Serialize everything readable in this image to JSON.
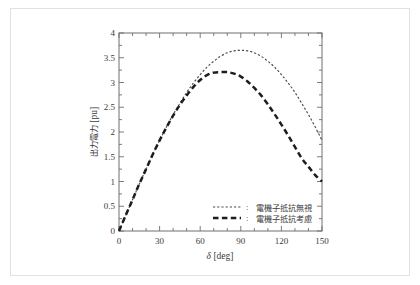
{
  "figure": {
    "frame_border_color": "#e2e2e2",
    "background": "#ffffff",
    "axis_color": "#6e6e6e",
    "text_color": "#3b3b3b"
  },
  "chart_data": {
    "type": "line",
    "title": "",
    "xlabel": "δ [deg]",
    "ylabel": "出力電力 [pu]",
    "xlim": [
      0,
      150
    ],
    "ylim": [
      0,
      4
    ],
    "xticks": [
      0,
      30,
      60,
      90,
      120,
      150
    ],
    "xtick_labels": [
      "0",
      "30",
      "60",
      "90",
      "120",
      "150"
    ],
    "yticks": [
      0,
      0.5,
      1,
      1.5,
      2,
      2.5,
      3,
      3.5,
      4
    ],
    "ytick_labels": [
      "0",
      "0.5",
      "1",
      "1.5",
      "2",
      "2.5",
      "3",
      "3.5",
      "4"
    ],
    "grid": false,
    "legend_position": "lower right",
    "x": [
      0,
      5,
      10,
      15,
      20,
      25,
      30,
      35,
      40,
      45,
      50,
      55,
      60,
      65,
      70,
      75,
      80,
      85,
      90,
      95,
      100,
      105,
      110,
      115,
      120,
      125,
      130,
      135,
      140,
      145,
      150
    ],
    "series": [
      {
        "name": "電機子抵抗無視",
        "style": "dotted",
        "color": "#4a4a4a",
        "linewidth": 1.15,
        "values": [
          0.0,
          0.32,
          0.63,
          0.95,
          1.25,
          1.55,
          1.83,
          2.1,
          2.35,
          2.58,
          2.8,
          2.99,
          3.16,
          3.31,
          3.43,
          3.53,
          3.6,
          3.64,
          3.65,
          3.64,
          3.6,
          3.53,
          3.43,
          3.31,
          3.16,
          2.99,
          2.8,
          2.58,
          2.35,
          2.1,
          1.83
        ],
        "peak_x": 90,
        "peak_y": 3.65
      },
      {
        "name": "電機子抵抗考慮",
        "style": "dashed",
        "color": "#1d1d1d",
        "linewidth": 2.5,
        "values": [
          0.0,
          0.32,
          0.63,
          0.95,
          1.25,
          1.55,
          1.83,
          2.09,
          2.33,
          2.55,
          2.74,
          2.91,
          3.05,
          3.15,
          3.2,
          3.21,
          3.21,
          3.18,
          3.12,
          3.02,
          2.89,
          2.74,
          2.56,
          2.36,
          2.15,
          1.93,
          1.7,
          1.47,
          1.3,
          1.13,
          1.0
        ],
        "peak_x": 82,
        "peak_y": 3.21
      }
    ]
  },
  "legend": {
    "separator": ":",
    "entries": [
      {
        "label": "電機子抵抗無視",
        "style": "dotted"
      },
      {
        "label": "電機子抵抗考慮",
        "style": "dashed"
      }
    ]
  }
}
